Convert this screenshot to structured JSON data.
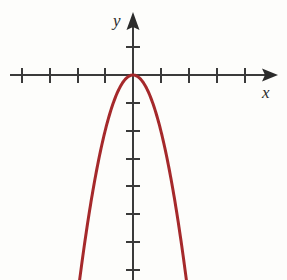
{
  "figure": {
    "kind": "cartesian-plot",
    "width": 287,
    "height": 280,
    "background_color": "#fdfdfb",
    "axis_color": "#3a3a3a",
    "curve_color": "#a5292b",
    "y_axis_label": "y",
    "x_axis_label": "x"
  },
  "chart_data": {
    "type": "line",
    "title": "",
    "subtitle": "",
    "xlabel": "x",
    "ylabel": "y",
    "grid": false,
    "legend": null,
    "axis_style": "arrows-both-ends-ticks-unlabeled",
    "tick_labels_shown": false,
    "xlim": [
      -4.4,
      5.2
    ],
    "ylim": [
      -7.4,
      2.1
    ],
    "xticks": [
      -4,
      -3,
      -2,
      -1,
      1,
      2,
      3,
      4
    ],
    "yticks": [
      1,
      -1,
      -2,
      -3,
      -4,
      -5,
      -6,
      -7
    ],
    "tick_spacing_units": 1,
    "series": [
      {
        "name": "y = -2x^2",
        "equation": "y = -2x^2",
        "vertex": [
          0,
          0
        ],
        "opens": "down",
        "leading_coefficient": -2,
        "color": "#a5292b",
        "x": [
          -1.92,
          -1.8,
          -1.6,
          -1.4,
          -1.2,
          -1.0,
          -0.8,
          -0.6,
          -0.4,
          -0.2,
          0,
          0.2,
          0.4,
          0.6,
          0.8,
          1.0,
          1.2,
          1.4,
          1.6,
          1.8,
          1.92
        ],
        "values": [
          -7.37,
          -6.48,
          -5.12,
          -3.92,
          -2.88,
          -2.0,
          -1.28,
          -0.72,
          -0.32,
          -0.08,
          0,
          -0.08,
          -0.32,
          -0.72,
          -1.28,
          -2.0,
          -2.88,
          -3.92,
          -5.12,
          -6.48,
          -7.37
        ]
      }
    ],
    "annotations": []
  }
}
